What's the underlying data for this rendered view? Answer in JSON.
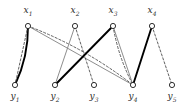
{
  "figure": {
    "type": "bipartite-graph-diagram",
    "width": 193,
    "height": 106,
    "background": "#ffffff"
  },
  "style": {
    "node_stroke": "#1a1a1a",
    "node_fill": "#ffffff",
    "node_radius": 2.6,
    "edge_thick_color": "#000000",
    "edge_thin_color": "#808080",
    "edge_dashed_color": "#4d4d4d",
    "label_color": "#2b2b2b"
  },
  "nodes": {
    "top": [
      {
        "id": "x1",
        "label": "x",
        "sub": "1",
        "x": 28,
        "y": 26,
        "label_x": 28,
        "label_y": 6
      },
      {
        "id": "x2",
        "label": "x",
        "sub": "2",
        "x": 75,
        "y": 26,
        "label_x": 75,
        "label_y": 6
      },
      {
        "id": "x3",
        "label": "x",
        "sub": "3",
        "x": 113,
        "y": 26,
        "label_x": 113,
        "label_y": 6
      },
      {
        "id": "x4",
        "label": "x",
        "sub": "4",
        "x": 152,
        "y": 26,
        "label_x": 152,
        "label_y": 6
      }
    ],
    "bottom": [
      {
        "id": "y1",
        "label": "y",
        "sub": "1",
        "x": 15,
        "y": 85,
        "label_x": 15,
        "label_y": 92
      },
      {
        "id": "y2",
        "label": "y",
        "sub": "2",
        "x": 55,
        "y": 85,
        "label_x": 55,
        "label_y": 92
      },
      {
        "id": "y3",
        "label": "y",
        "sub": "3",
        "x": 94,
        "y": 85,
        "label_x": 94,
        "label_y": 92
      },
      {
        "id": "y4",
        "label": "y",
        "sub": "4",
        "x": 133,
        "y": 85,
        "label_x": 133,
        "label_y": 92
      },
      {
        "id": "y5",
        "label": "y",
        "sub": "5",
        "x": 172,
        "y": 85,
        "label_x": 172,
        "label_y": 92
      }
    ]
  },
  "edges": [
    {
      "from": "x1",
      "to": "y1",
      "kind": "thick-solid-curved",
      "x1": 28,
      "y1": 26,
      "x2": 15,
      "y2": 85,
      "curve": -7
    },
    {
      "from": "x1",
      "to": "y1",
      "kind": "dashed",
      "x1": 28,
      "y1": 26,
      "x2": 15,
      "y2": 85,
      "curve": 0
    },
    {
      "from": "x1",
      "to": "y4",
      "kind": "thin-solid",
      "x1": 28,
      "y1": 26,
      "x2": 133,
      "y2": 85,
      "curve": 0
    },
    {
      "from": "x1",
      "to": "y4",
      "kind": "dashed",
      "x1": 28,
      "y1": 26,
      "x2": 133,
      "y2": 85,
      "curve": -9
    },
    {
      "from": "x2",
      "to": "y2",
      "kind": "thin-solid",
      "x1": 75,
      "y1": 26,
      "x2": 55,
      "y2": 85,
      "curve": 0
    },
    {
      "from": "x2",
      "to": "y3",
      "kind": "dashed",
      "x1": 75,
      "y1": 26,
      "x2": 94,
      "y2": 85,
      "curve": 0
    },
    {
      "from": "x3",
      "to": "y2",
      "kind": "thick-solid",
      "x1": 113,
      "y1": 26,
      "x2": 55,
      "y2": 85,
      "curve": 0
    },
    {
      "from": "x3",
      "to": "y4",
      "kind": "thin-solid",
      "x1": 113,
      "y1": 26,
      "x2": 133,
      "y2": 85,
      "curve": 0
    },
    {
      "from": "x3",
      "to": "y4",
      "kind": "dashed",
      "x1": 113,
      "y1": 26,
      "x2": 133,
      "y2": 85,
      "curve": 5
    },
    {
      "from": "x4",
      "to": "y4",
      "kind": "thick-solid",
      "x1": 152,
      "y1": 26,
      "x2": 133,
      "y2": 85,
      "curve": 0
    },
    {
      "from": "x4",
      "to": "y5",
      "kind": "dashed",
      "x1": 152,
      "y1": 26,
      "x2": 172,
      "y2": 85,
      "curve": 0
    }
  ]
}
